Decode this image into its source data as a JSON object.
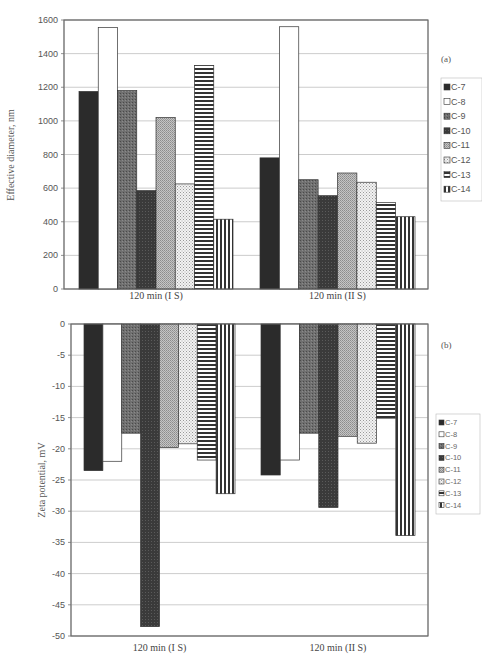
{
  "chart_data": [
    {
      "type": "bar",
      "panel_label": "(a)",
      "title": "",
      "xlabel": "",
      "ylabel": "Effective diameter, nm",
      "ylim": [
        0,
        1600
      ],
      "yticks": [
        0,
        200,
        400,
        600,
        800,
        1000,
        1200,
        1400,
        1600
      ],
      "grid": true,
      "legend_position": "right",
      "categories": [
        "120 min (I S)",
        "120 min (II S)"
      ],
      "series": [
        {
          "name": "C-7",
          "values": [
            1175,
            780
          ]
        },
        {
          "name": "C-8",
          "values": [
            1555,
            1560
          ]
        },
        {
          "name": "C-9",
          "values": [
            1180,
            650
          ]
        },
        {
          "name": "C-10",
          "values": [
            585,
            555
          ]
        },
        {
          "name": "C-11",
          "values": [
            1020,
            690
          ]
        },
        {
          "name": "C-12",
          "values": [
            625,
            635
          ]
        },
        {
          "name": "C-13",
          "values": [
            1330,
            515
          ]
        },
        {
          "name": "C-14",
          "values": [
            415,
            430
          ]
        }
      ]
    },
    {
      "type": "bar",
      "panel_label": "(b)",
      "title": "",
      "xlabel": "",
      "ylabel": "Zeta potential, mV",
      "ylim": [
        -50,
        0
      ],
      "yticks": [
        0,
        -5,
        -10,
        -15,
        -20,
        -25,
        -30,
        -35,
        -40,
        -45,
        -50
      ],
      "grid": true,
      "legend_position": "right",
      "categories": [
        "120 min (I S)",
        "120 min (II S)"
      ],
      "series": [
        {
          "name": "C-7",
          "values": [
            -23.5,
            -24.2
          ]
        },
        {
          "name": "C-8",
          "values": [
            -22.0,
            -21.8
          ]
        },
        {
          "name": "C-9",
          "values": [
            -17.5,
            -17.5
          ]
        },
        {
          "name": "C-10",
          "values": [
            -48.5,
            -29.4
          ]
        },
        {
          "name": "C-11",
          "values": [
            -19.8,
            -18.0
          ]
        },
        {
          "name": "C-12",
          "values": [
            -19.2,
            -19.1
          ]
        },
        {
          "name": "C-13",
          "values": [
            -21.8,
            -15.1
          ]
        },
        {
          "name": "C-14",
          "values": [
            -27.2,
            -33.9
          ]
        }
      ]
    }
  ],
  "series_styles": {
    "C-7": {
      "fill": "#2b2b2b",
      "pattern": "solid-dark"
    },
    "C-8": {
      "fill": "#ffffff",
      "pattern": "solid-white"
    },
    "C-9": {
      "fill": "#6e6e6e",
      "pattern": "speckle-medium"
    },
    "C-10": {
      "fill": "#3c3c3c",
      "pattern": "speckle-dark"
    },
    "C-11": {
      "fill": "#b4b4b4",
      "pattern": "fine-dots"
    },
    "C-12": {
      "fill": "#e6e6e6",
      "pattern": "sparse-dots"
    },
    "C-13": {
      "fill": "#ffffff",
      "pattern": "horizontal-stripes"
    },
    "C-14": {
      "fill": "#ffffff",
      "pattern": "vertical-stripes"
    }
  }
}
